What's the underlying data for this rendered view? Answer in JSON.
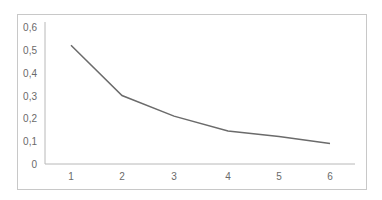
{
  "chart_data": {
    "type": "line",
    "title": "",
    "xlabel": "",
    "ylabel": "",
    "x": [
      1,
      2,
      3,
      4,
      5,
      6
    ],
    "categories": [
      "1",
      "2",
      "3",
      "4",
      "5",
      "6"
    ],
    "series": [
      {
        "name": "Series 1",
        "values": [
          0.52,
          0.3,
          0.21,
          0.145,
          0.12,
          0.09
        ],
        "color": "#6b6b6b"
      }
    ],
    "ylim": [
      0,
      0.6
    ],
    "yticks": [
      "0",
      "0,1",
      "0,2",
      "0,3",
      "0,4",
      "0,5",
      "0,6"
    ],
    "grid": false,
    "legend": "none"
  }
}
